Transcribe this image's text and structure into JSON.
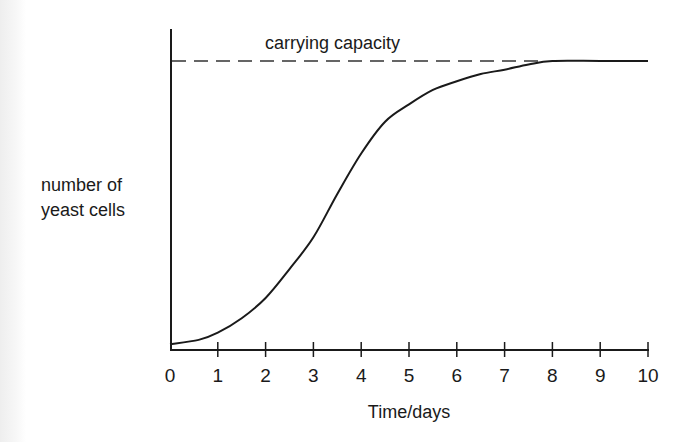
{
  "chart_data": {
    "type": "line",
    "title": "",
    "xlabel": "Time/days",
    "ylabel": "number of yeast cells",
    "ylabel_lines": [
      "number of",
      "yeast cells"
    ],
    "x_ticks": [
      "0",
      "1",
      "2",
      "3",
      "4",
      "5",
      "6",
      "7",
      "8",
      "9",
      "10"
    ],
    "xlim": [
      0,
      10
    ],
    "ylim": [
      0,
      100
    ],
    "y_ticks": [],
    "grid": false,
    "legend": null,
    "annotations": [
      {
        "text": "carrying capacity",
        "type": "dashed-horizontal-line",
        "y": 100
      }
    ],
    "series": [
      {
        "name": "yeast population",
        "x": [
          0,
          0.6,
          1,
          1.5,
          2,
          2.5,
          3,
          3.5,
          4,
          4.5,
          5,
          5.5,
          6,
          6.5,
          7,
          7.5,
          8,
          9,
          10
        ],
        "values": [
          2,
          3.5,
          6,
          11,
          18,
          28,
          39,
          54,
          68,
          79,
          85,
          90,
          93,
          95.5,
          97,
          98.8,
          100,
          100,
          100
        ]
      }
    ],
    "carrying_capacity": 100
  },
  "labels": {
    "annotation": "carrying capacity",
    "xlabel": "Time/days",
    "ylabel_line1": "number of",
    "ylabel_line2": "yeast cells",
    "ticks": [
      "0",
      "1",
      "2",
      "3",
      "4",
      "5",
      "6",
      "7",
      "8",
      "9",
      "10"
    ]
  },
  "colors": {
    "axis": "#1a1a1a",
    "curve": "#1a1a1a",
    "dashed": "#333333",
    "background": "#ffffff"
  }
}
